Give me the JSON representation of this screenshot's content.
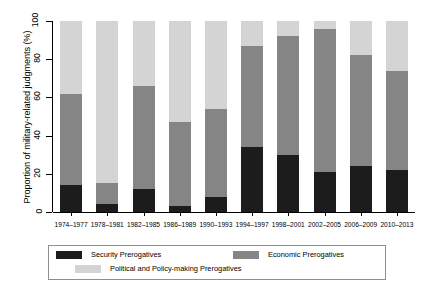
{
  "chart_data": {
    "type": "bar",
    "stacked": true,
    "title": "",
    "xlabel": "",
    "ylabel": "Proportion of military-related judgments (%)",
    "ylim": [
      0,
      100
    ],
    "yticks": [
      0,
      20,
      40,
      60,
      80,
      100
    ],
    "grid": false,
    "legend_position": "bottom",
    "categories": [
      "1974–1977",
      "1978–1981",
      "1982–1985",
      "1986–1989",
      "1990–1993",
      "1994–1997",
      "1998–2001",
      "2002–2005",
      "2006–2009",
      "2010–2013"
    ],
    "series": [
      {
        "name": "Security Prerogatives",
        "color": "#1c1c1c",
        "values": [
          14,
          4,
          12,
          3,
          8,
          34,
          30,
          21,
          24,
          22
        ]
      },
      {
        "name": "Economic Prerogatives",
        "color": "#858585",
        "values": [
          48,
          11,
          54,
          44,
          46,
          53,
          62,
          75,
          58,
          52
        ]
      },
      {
        "name": "Political and Policy-making Prerogatives",
        "color": "#d4d4d4",
        "values": [
          38,
          85,
          34,
          53,
          46,
          13,
          8,
          4,
          18,
          26
        ]
      }
    ],
    "cumulative_tops": {
      "security": [
        14,
        4,
        12,
        3,
        8,
        34,
        30,
        21,
        24,
        22
      ],
      "economic": [
        62,
        15,
        66,
        47,
        54,
        87,
        92,
        96,
        82,
        74
      ],
      "political": [
        100,
        100,
        100,
        100,
        100,
        100,
        100,
        100,
        100,
        100
      ]
    }
  },
  "legend": {
    "items": [
      {
        "label": "Security Prerogatives",
        "color": "#1c1c1c"
      },
      {
        "label": "Economic Prerogatives",
        "color": "#858585"
      },
      {
        "label": "Political and Policy-making Prerogatives",
        "color": "#d4d4d4"
      }
    ]
  }
}
